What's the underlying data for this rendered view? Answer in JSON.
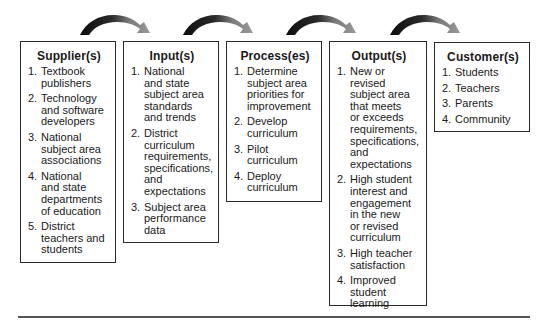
{
  "diagram": {
    "type": "SIPOC flow",
    "boxes": [
      {
        "id": "supplier",
        "title": "Supplier(s)",
        "items": [
          {
            "num": "1.",
            "text": "Textbook\npublishers"
          },
          {
            "num": "2.",
            "text": "Technology\nand software\ndevelopers"
          },
          {
            "num": "3.",
            "text": "National\nsubject area\nassociations"
          },
          {
            "num": "4.",
            "text": "National\nand state\ndepartments\nof education"
          },
          {
            "num": "5.",
            "text": "District\nteachers and\nstudents"
          }
        ]
      },
      {
        "id": "input",
        "title": "Input(s)",
        "items": [
          {
            "num": "1.",
            "text": "National\nand state\nsubject area\nstandards\nand trends"
          },
          {
            "num": "2.",
            "text": "District\ncurriculum\nrequirements,\nspecifications,\nand\nexpectations"
          },
          {
            "num": "3.",
            "text": "Subject area\nperformance\ndata"
          }
        ]
      },
      {
        "id": "process",
        "title": "Process(es)",
        "items": [
          {
            "num": "1.",
            "text": "Determine\nsubject area\npriorities for\nimprovement"
          },
          {
            "num": "2.",
            "text": "Develop\ncurriculum"
          },
          {
            "num": "3.",
            "text": "Pilot\ncurriculum"
          },
          {
            "num": "4.",
            "text": "Deploy\ncurriculum"
          }
        ]
      },
      {
        "id": "output",
        "title": "Output(s)",
        "items": [
          {
            "num": "1.",
            "text": "New or revised\nsubject area\nthat meets\nor exceeds\nrequirements,\nspecifications,\nand\nexpectations"
          },
          {
            "num": "2.",
            "text": "High student\ninterest and\nengagement\nin the new\nor revised\ncurriculum"
          },
          {
            "num": "3.",
            "text": "High teacher\nsatisfaction"
          },
          {
            "num": "4.",
            "text": "Improved\nstudent\nlearning"
          }
        ]
      },
      {
        "id": "customer",
        "title": "Customer(s)",
        "items": [
          {
            "num": "1.",
            "text": "Students"
          },
          {
            "num": "2.",
            "text": "Teachers"
          },
          {
            "num": "3.",
            "text": "Parents"
          },
          {
            "num": "4.",
            "text": "Community"
          }
        ]
      }
    ],
    "arrows": [
      {
        "from": "supplier",
        "to": "input"
      },
      {
        "from": "input",
        "to": "process"
      },
      {
        "from": "process",
        "to": "output"
      },
      {
        "from": "output",
        "to": "customer"
      }
    ],
    "colors": {
      "border": "#2a2a2a",
      "arrow_dark": "#111111",
      "arrow_light": "#8a8a8a",
      "rule": "#555555"
    }
  }
}
